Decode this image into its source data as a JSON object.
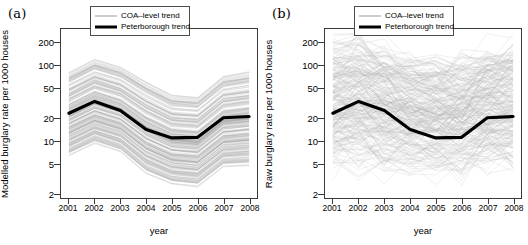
{
  "figure": {
    "panels": [
      {
        "tag": "(a)",
        "title": "Modelled rates",
        "ylabel": "Modelled burglary rate per 1000 houses",
        "xlabel": "year"
      },
      {
        "tag": "(b)",
        "title": "Raw rates",
        "ylabel": "Raw burglary rate per 1000 houses",
        "xlabel": "year"
      }
    ],
    "legend": {
      "items": [
        {
          "label": "COA–level trend",
          "style": "thin-grey-line",
          "color": "#9a9a9a"
        },
        {
          "label": "Peterborough trend",
          "style": "thick-black-line",
          "color": "#000000"
        }
      ]
    }
  },
  "chart_data": [
    {
      "type": "line",
      "title": "Modelled rates",
      "panel_tag": "(a)",
      "xlabel": "year",
      "ylabel": "Modelled burglary rate per 1000 houses",
      "x": [
        2001,
        2002,
        2003,
        2004,
        2005,
        2006,
        2007,
        2008
      ],
      "xtick_labels": [
        "2001",
        "2002",
        "2003",
        "2004",
        "2005",
        "2006",
        "2007",
        "2008"
      ],
      "yscale": "log",
      "ylim": [
        2,
        260
      ],
      "ytick_values": [
        200,
        100,
        50,
        20,
        10,
        5,
        2
      ],
      "ytick_labels": [
        "200",
        "100",
        "50",
        "20",
        "10",
        "5",
        "2"
      ],
      "grid": false,
      "legend_position": "top-right-inside",
      "series": [
        {
          "name": "Peterborough trend",
          "style": "thick-black-line",
          "color": "#000000",
          "values": [
            23,
            33,
            25,
            14,
            10.8,
            11,
            20,
            20.8
          ]
        },
        {
          "name": "COA-level trend",
          "style": "thin-grey-lines-bundle",
          "color": "#9a9a9a",
          "description": "Approximately 400 smooth COA-level trajectories forming a dense band that follows the Peterborough trend shape",
          "envelope_upper": [
            80,
            120,
            95,
            60,
            40,
            38,
            72,
            82
          ],
          "envelope_lower": [
            6.2,
            9.0,
            7.0,
            3.6,
            2.6,
            2.4,
            4.4,
            4.6
          ],
          "band_count": 400
        }
      ]
    },
    {
      "type": "line",
      "title": "Raw rates",
      "panel_tag": "(b)",
      "xlabel": "year",
      "ylabel": "Raw burglary rate per 1000 houses",
      "x": [
        2001,
        2002,
        2003,
        2004,
        2005,
        2006,
        2007,
        2008
      ],
      "xtick_labels": [
        "2001",
        "2002",
        "2003",
        "2004",
        "2005",
        "2006",
        "2007",
        "2008"
      ],
      "yscale": "log",
      "ylim": [
        2,
        260
      ],
      "ytick_values": [
        200,
        100,
        50,
        20,
        10,
        5,
        2
      ],
      "ytick_labels": [
        "200",
        "100",
        "50",
        "20",
        "10",
        "5",
        "2"
      ],
      "grid": false,
      "legend_position": "top-right-inside",
      "series": [
        {
          "name": "Peterborough trend",
          "style": "thick-black-line",
          "color": "#000000",
          "values": [
            23,
            33,
            25,
            14,
            10.8,
            11,
            20,
            20.8
          ]
        },
        {
          "name": "COA-level trend",
          "style": "thin-grey-lines-noisy",
          "color": "#9a9a9a",
          "description": "Approximately 400 noisy year-to-year COA-level raw rate trajectories with large zig-zag variation, spanning roughly 5 to 200 per 1000 houses",
          "envelope_upper": [
            150,
            200,
            150,
            110,
            95,
            95,
            140,
            150
          ],
          "envelope_lower": [
            5.5,
            6.0,
            5.5,
            5.0,
            5.0,
            5.0,
            5.5,
            5.5
          ],
          "band_count": 400
        }
      ]
    }
  ]
}
